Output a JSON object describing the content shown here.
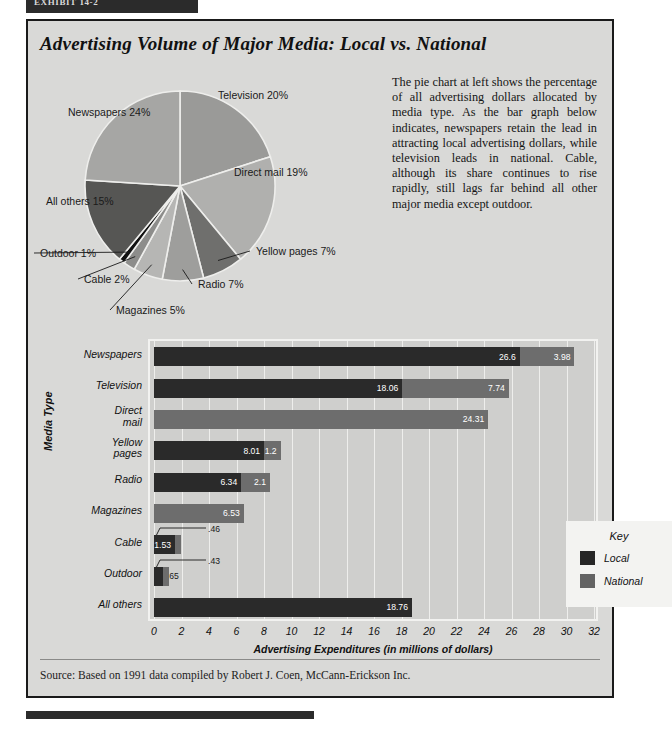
{
  "exhibit_tab": {
    "label": "EXHIBIT 14-2"
  },
  "headline": "Advertising Volume of Major Media: Local vs. National",
  "body_copy": "The pie chart at left shows the percentage of all advertising dollars allocated by media type. As the bar graph below indicates, newspapers retain the lead in attracting local advertising dollars, while television leads in national. Cable, although its share continues to rise rapidly, still lags far behind all other major media except outdoor.",
  "source": "Source: Based on 1991 data compiled by Robert J. Coen, McCann-Erickson Inc.",
  "legend": {
    "title": "Key",
    "items": [
      {
        "label": "Local",
        "color": "#262626"
      },
      {
        "label": "National",
        "color": "#636363"
      }
    ]
  },
  "chart_data": [
    {
      "type": "pie",
      "title": "Advertising Volume of Major Media",
      "legend_position": "labels-outside",
      "categories": [
        "Television",
        "Direct mail",
        "Yellow pages",
        "Radio",
        "Magazines",
        "Cable",
        "Outdoor",
        "All others",
        "Newspapers"
      ],
      "values": [
        20,
        19,
        7,
        7,
        5,
        2,
        1,
        15,
        24
      ],
      "labels": [
        "Television 20%",
        "Direct mail 19%",
        "Yellow pages 7%",
        "Radio 7%",
        "Magazines 5%",
        "Cable 2%",
        "Outdoor 1%",
        "All others 15%",
        "Newspapers 24%"
      ],
      "unit": "%"
    },
    {
      "type": "bar",
      "orientation": "horizontal",
      "stacked": true,
      "title": "",
      "xlabel": "Advertising Expenditures (in millions of dollars)",
      "ylabel": "Media Type",
      "xlim": [
        0,
        32
      ],
      "xticks": [
        0,
        2,
        4,
        6,
        8,
        10,
        12,
        14,
        16,
        18,
        20,
        22,
        24,
        26,
        28,
        30,
        32
      ],
      "grid": true,
      "categories": [
        "Newspapers",
        "Television",
        "Direct mail",
        "Yellow pages",
        "Radio",
        "Magazines",
        "Cable",
        "Outdoor",
        "All others"
      ],
      "series": [
        {
          "name": "Local",
          "color": "#2a2a2a",
          "values": [
            26.6,
            18.06,
            0,
            8.01,
            6.34,
            0,
            1.53,
            0.65,
            18.76
          ]
        },
        {
          "name": "National",
          "color": "#6d6d6d",
          "values": [
            3.98,
            7.74,
            24.31,
            1.2,
            2.1,
            6.53,
            0.46,
            0.43,
            0
          ]
        }
      ],
      "data_labels": {
        "Newspapers": {
          "local": "26.6",
          "national": "3.98"
        },
        "Television": {
          "local": "18.06",
          "national": "7.74"
        },
        "Direct mail": {
          "local": "",
          "national": "24.31"
        },
        "Yellow pages": {
          "local": "8.01",
          "national": "1.2"
        },
        "Radio": {
          "local": "6.34",
          "national": "2.1"
        },
        "Magazines": {
          "local": "",
          "national": "6.53"
        },
        "Cable": {
          "local": "1.53",
          "national": ".46"
        },
        "Outdoor": {
          "local": ".65",
          "national": ".43"
        },
        "All others": {
          "local": "18.76",
          "national": ""
        }
      }
    }
  ]
}
